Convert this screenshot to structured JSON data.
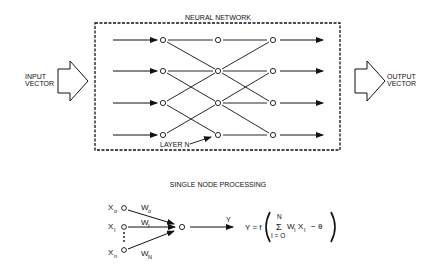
{
  "network": {
    "title": "NEURAL NETWORK",
    "input_label_line1": "INPUT",
    "input_label_line2": "VECTOR",
    "output_label_line1": "OUTPUT",
    "output_label_line2": "VECTOR",
    "layer_label": "LAYER N",
    "node_glyph": "O",
    "rows": 4,
    "columns": 3,
    "connections": [
      {
        "from": [
          0,
          0
        ],
        "to": [
          1,
          0
        ]
      },
      {
        "from": [
          0,
          0
        ],
        "to": [
          1,
          1
        ]
      },
      {
        "from": [
          0,
          1
        ],
        "to": [
          1,
          1
        ]
      },
      {
        "from": [
          0,
          1
        ],
        "to": [
          1,
          2
        ]
      },
      {
        "from": [
          0,
          2
        ],
        "to": [
          1,
          1
        ]
      },
      {
        "from": [
          0,
          2
        ],
        "to": [
          1,
          3
        ]
      },
      {
        "from": [
          0,
          3
        ],
        "to": [
          1,
          2
        ]
      },
      {
        "from": [
          1,
          0
        ],
        "to": [
          2,
          0
        ]
      },
      {
        "from": [
          1,
          1
        ],
        "to": [
          2,
          0
        ]
      },
      {
        "from": [
          1,
          1
        ],
        "to": [
          2,
          1
        ]
      },
      {
        "from": [
          1,
          1
        ],
        "to": [
          2,
          2
        ]
      },
      {
        "from": [
          1,
          2
        ],
        "to": [
          2,
          1
        ]
      },
      {
        "from": [
          1,
          2
        ],
        "to": [
          2,
          2
        ]
      },
      {
        "from": [
          1,
          2
        ],
        "to": [
          2,
          3
        ]
      },
      {
        "from": [
          1,
          3
        ],
        "to": [
          2,
          3
        ]
      }
    ]
  },
  "single_node": {
    "title": "SINGLE NODE PROCESSING",
    "inputs": [
      {
        "x": "X",
        "x_sub": "o",
        "w": "W",
        "w_sub": "o"
      },
      {
        "x": "X",
        "x_sub": "I",
        "w": "W",
        "w_sub": "I"
      },
      {
        "x": "X",
        "x_sub": "n",
        "w": "W",
        "w_sub": "N"
      }
    ],
    "output_label": "Y",
    "formula": {
      "lhs": "Y = f",
      "sum_upper": "N",
      "sum_symbol": "Σ",
      "sum_lower": "I = O",
      "term": "W",
      "term_sub": "I",
      "term2": "X",
      "term2_sub": "I",
      "tail": "−  θ"
    }
  }
}
